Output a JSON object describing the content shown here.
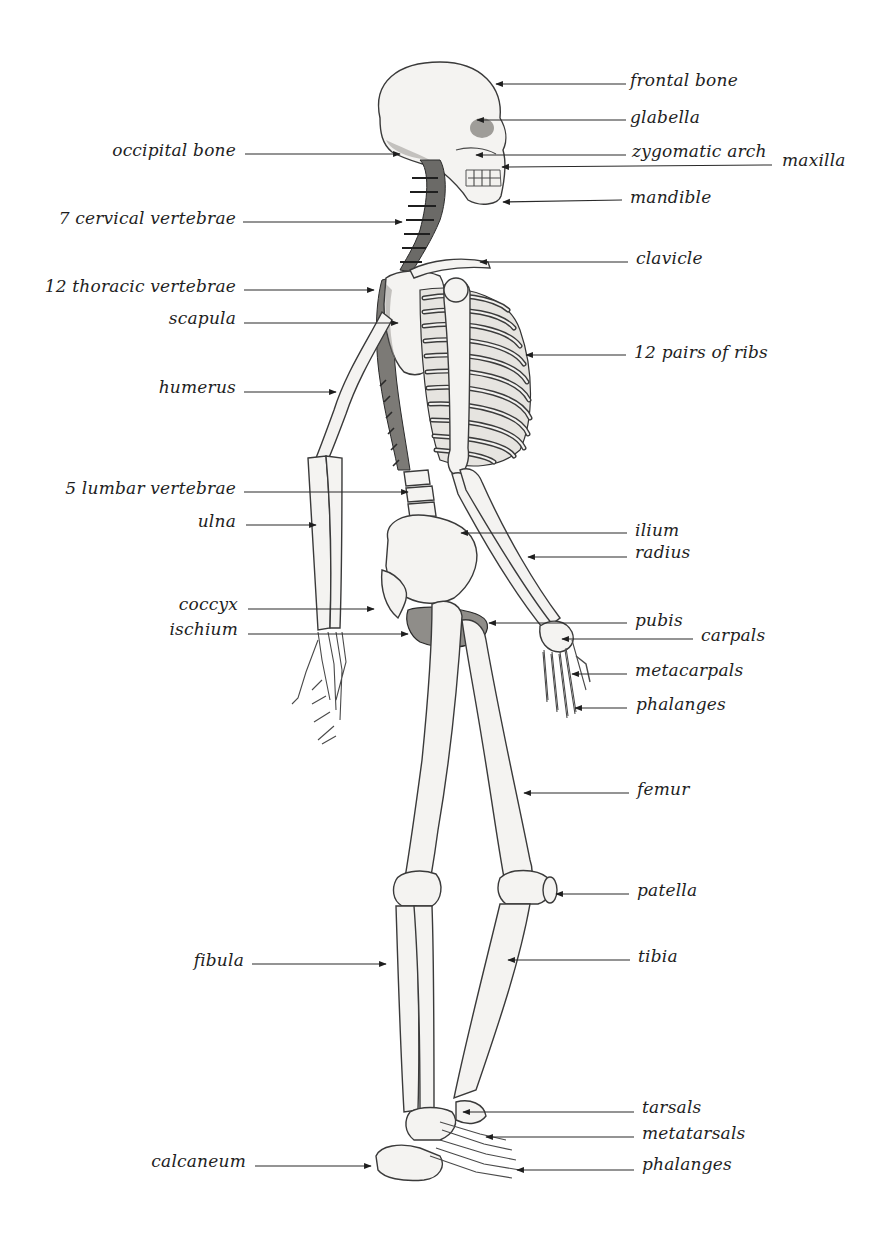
{
  "diagram": {
    "background": "#ffffff",
    "label_color": "#1e1e1e",
    "line_color": "#2a2a2a",
    "labels": [
      {
        "id": "frontal-bone",
        "text": "frontal bone",
        "side": "right",
        "tx": 630,
        "ty": 80,
        "x1": 626,
        "y1": 84,
        "x2": 496,
        "y2": 84
      },
      {
        "id": "glabella",
        "text": "glabella",
        "side": "right",
        "tx": 630,
        "ty": 117,
        "x1": 626,
        "y1": 120,
        "x2": 477,
        "y2": 120
      },
      {
        "id": "zygomatic-arch",
        "text": "zygomatic arch",
        "side": "right",
        "tx": 632,
        "ty": 151,
        "x1": 626,
        "y1": 155,
        "x2": 476,
        "y2": 155
      },
      {
        "id": "maxilla",
        "text": "maxilla",
        "side": "right",
        "tx": 782,
        "ty": 160,
        "x1": 772,
        "y1": 165,
        "x2": 502,
        "y2": 167
      },
      {
        "id": "mandible",
        "text": "mandible",
        "side": "right",
        "tx": 630,
        "ty": 197,
        "x1": 622,
        "y1": 200,
        "x2": 503,
        "y2": 202
      },
      {
        "id": "clavicle",
        "text": "clavicle",
        "side": "right",
        "tx": 636,
        "ty": 258,
        "x1": 628,
        "y1": 262,
        "x2": 480,
        "y2": 262
      },
      {
        "id": "ribs",
        "text": "12 pairs of ribs",
        "side": "right",
        "tx": 634,
        "ty": 352,
        "x1": 626,
        "y1": 355,
        "x2": 526,
        "y2": 355
      },
      {
        "id": "ilium",
        "text": "ilium",
        "side": "right",
        "tx": 635,
        "ty": 530,
        "x1": 627,
        "y1": 533,
        "x2": 461,
        "y2": 533
      },
      {
        "id": "radius",
        "text": "radius",
        "side": "right",
        "tx": 635,
        "ty": 552,
        "x1": 627,
        "y1": 557,
        "x2": 528,
        "y2": 557
      },
      {
        "id": "pubis",
        "text": "pubis",
        "side": "right",
        "tx": 635,
        "ty": 620,
        "x1": 627,
        "y1": 623,
        "x2": 489,
        "y2": 623
      },
      {
        "id": "carpals",
        "text": "carpals",
        "side": "right",
        "tx": 701,
        "ty": 635,
        "x1": 693,
        "y1": 639,
        "x2": 562,
        "y2": 639
      },
      {
        "id": "metacarpals",
        "text": "metacarpals",
        "side": "right",
        "tx": 635,
        "ty": 670,
        "x1": 627,
        "y1": 674,
        "x2": 572,
        "y2": 674
      },
      {
        "id": "phalanges-hand",
        "text": "phalanges",
        "side": "right",
        "tx": 636,
        "ty": 704,
        "x1": 627,
        "y1": 708,
        "x2": 575,
        "y2": 708
      },
      {
        "id": "femur",
        "text": "femur",
        "side": "right",
        "tx": 637,
        "ty": 789,
        "x1": 629,
        "y1": 793,
        "x2": 524,
        "y2": 793
      },
      {
        "id": "patella",
        "text": "patella",
        "side": "right",
        "tx": 637,
        "ty": 890,
        "x1": 629,
        "y1": 894,
        "x2": 556,
        "y2": 894
      },
      {
        "id": "tibia",
        "text": "tibia",
        "side": "right",
        "tx": 638,
        "ty": 956,
        "x1": 630,
        "y1": 960,
        "x2": 508,
        "y2": 960
      },
      {
        "id": "tarsals",
        "text": "tarsals",
        "side": "right",
        "tx": 642,
        "ty": 1107,
        "x1": 634,
        "y1": 1112,
        "x2": 463,
        "y2": 1112
      },
      {
        "id": "metatarsals",
        "text": "metatarsals",
        "side": "right",
        "tx": 642,
        "ty": 1133,
        "x1": 634,
        "y1": 1137,
        "x2": 486,
        "y2": 1137
      },
      {
        "id": "phalanges-foot",
        "text": "phalanges",
        "side": "right",
        "tx": 642,
        "ty": 1164,
        "x1": 634,
        "y1": 1170,
        "x2": 517,
        "y2": 1170
      },
      {
        "id": "occipital-bone",
        "text": "occipital bone",
        "side": "left",
        "tx": 236,
        "ty": 150,
        "x1": 245,
        "y1": 154,
        "x2": 400,
        "y2": 154
      },
      {
        "id": "cervical-vertebrae",
        "text": "7 cervical vertebrae",
        "side": "left",
        "tx": 236,
        "ty": 218,
        "x1": 243,
        "y1": 222,
        "x2": 402,
        "y2": 222
      },
      {
        "id": "thoracic-vertebrae",
        "text": "12 thoracic vertebrae",
        "side": "left",
        "tx": 236,
        "ty": 286,
        "x1": 244,
        "y1": 290,
        "x2": 374,
        "y2": 290
      },
      {
        "id": "scapula",
        "text": "scapula",
        "side": "left",
        "tx": 236,
        "ty": 318,
        "x1": 244,
        "y1": 323,
        "x2": 398,
        "y2": 323
      },
      {
        "id": "humerus",
        "text": "humerus",
        "side": "left",
        "tx": 236,
        "ty": 387,
        "x1": 244,
        "y1": 392,
        "x2": 336,
        "y2": 392
      },
      {
        "id": "lumbar-vertebrae",
        "text": "5 lumbar vertebrae",
        "side": "left",
        "tx": 236,
        "ty": 488,
        "x1": 244,
        "y1": 492,
        "x2": 408,
        "y2": 492
      },
      {
        "id": "ulna",
        "text": "ulna",
        "side": "left",
        "tx": 236,
        "ty": 521,
        "x1": 246,
        "y1": 525,
        "x2": 316,
        "y2": 525
      },
      {
        "id": "coccyx",
        "text": "coccyx",
        "side": "left",
        "tx": 238,
        "ty": 604,
        "x1": 248,
        "y1": 609,
        "x2": 374,
        "y2": 609
      },
      {
        "id": "ischium",
        "text": "ischium",
        "side": "left",
        "tx": 238,
        "ty": 629,
        "x1": 248,
        "y1": 634,
        "x2": 408,
        "y2": 634
      },
      {
        "id": "fibula",
        "text": "fibula",
        "side": "left",
        "tx": 244,
        "ty": 960,
        "x1": 252,
        "y1": 964,
        "x2": 386,
        "y2": 964
      },
      {
        "id": "calcaneum",
        "text": "calcaneum",
        "side": "left",
        "tx": 246,
        "ty": 1161,
        "x1": 255,
        "y1": 1166,
        "x2": 371,
        "y2": 1166
      }
    ]
  }
}
